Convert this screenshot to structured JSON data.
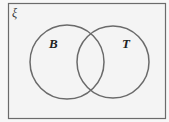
{
  "diagram": {
    "type": "venn",
    "universal_set_symbol": "ξ",
    "sets": [
      {
        "label": "B",
        "cx": 67,
        "cy": 62,
        "r": 37
      },
      {
        "label": "T",
        "cx": 113,
        "cy": 62,
        "r": 36
      }
    ],
    "colors": {
      "background": "#f7f7f7",
      "frame": "#6b6b6b",
      "circle_stroke": "#6a6a6a",
      "text": "#222222"
    }
  }
}
